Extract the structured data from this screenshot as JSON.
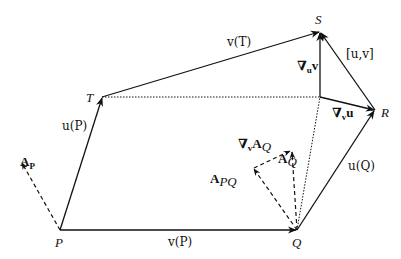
{
  "diagram": {
    "type": "vector-field commutator / covariant derivative diagram",
    "points": {
      "P": {
        "label": "P"
      },
      "Q": {
        "label": "Q"
      },
      "R": {
        "label": "R"
      },
      "S": {
        "label": "S"
      },
      "T": {
        "label": "T"
      }
    },
    "vectors": {
      "uP": {
        "label": "u(P)"
      },
      "vP": {
        "label": "v(P)"
      },
      "uQ": {
        "label": "u(Q)"
      },
      "vT": {
        "label": "v(T)"
      },
      "nabla_u_v": {
        "label": "∇uv",
        "main": "∇",
        "sub": "u",
        "tail": "v"
      },
      "nabla_v_u": {
        "label": "∇vu",
        "main": "∇",
        "sub": "v",
        "tail": "u"
      },
      "bracket": {
        "label": "[u,v]"
      },
      "A_P": {
        "label": "AP",
        "main": "A",
        "sub": "P"
      },
      "A_PQ": {
        "label": "APQ",
        "main": "A",
        "sub": "PQ"
      },
      "A_Q": {
        "label": "AQ",
        "main": "A",
        "sub": "Q"
      },
      "nabla_v_AQ": {
        "label": "∇vAQ",
        "main": "∇",
        "sub": "v",
        "tail": "A",
        "tailsub": "Q"
      }
    },
    "colors": {
      "stroke": "#111111",
      "background": "#ffffff"
    }
  }
}
